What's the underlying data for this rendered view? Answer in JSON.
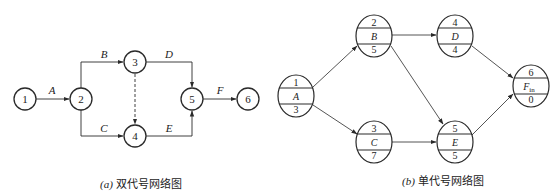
{
  "diagram_a": {
    "caption_letter": "(a)",
    "caption_text": " 双代号网络图",
    "nodes": [
      {
        "id": "1",
        "label": "1"
      },
      {
        "id": "2",
        "label": "2"
      },
      {
        "id": "3",
        "label": "3"
      },
      {
        "id": "4",
        "label": "4"
      },
      {
        "id": "5",
        "label": "5"
      },
      {
        "id": "6",
        "label": "6"
      }
    ],
    "edges": [
      {
        "from": "1",
        "to": "2",
        "label": "A",
        "dashed": false
      },
      {
        "from": "2",
        "to": "3",
        "label": "B",
        "dashed": false
      },
      {
        "from": "2",
        "to": "4",
        "label": "C",
        "dashed": false
      },
      {
        "from": "3",
        "to": "5",
        "label": "D",
        "dashed": false
      },
      {
        "from": "4",
        "to": "5",
        "label": "E",
        "dashed": false
      },
      {
        "from": "3",
        "to": "4",
        "label": "",
        "dashed": true
      },
      {
        "from": "5",
        "to": "6",
        "label": "F",
        "dashed": false
      }
    ]
  },
  "diagram_b": {
    "caption_letter": "(b)",
    "caption_text": " 单代号网络图",
    "nodes": [
      {
        "id": "A",
        "top": "1",
        "name": "A",
        "bottom": "3"
      },
      {
        "id": "B",
        "top": "2",
        "name": "B",
        "bottom": "5"
      },
      {
        "id": "C",
        "top": "3",
        "name": "C",
        "bottom": "7"
      },
      {
        "id": "D",
        "top": "4",
        "name": "D",
        "bottom": "4"
      },
      {
        "id": "E",
        "top": "5",
        "name": "E",
        "bottom": "5"
      },
      {
        "id": "Fin",
        "top": "6",
        "name": "F",
        "name_sub": "in",
        "bottom": "0"
      }
    ],
    "edges": [
      {
        "from": "A",
        "to": "B"
      },
      {
        "from": "A",
        "to": "C"
      },
      {
        "from": "B",
        "to": "D"
      },
      {
        "from": "B",
        "to": "E"
      },
      {
        "from": "C",
        "to": "E"
      },
      {
        "from": "D",
        "to": "Fin"
      },
      {
        "from": "E",
        "to": "Fin"
      }
    ]
  },
  "colors": {
    "stroke": "#2a2a2a",
    "text": "#222222",
    "background": "#ffffff"
  }
}
